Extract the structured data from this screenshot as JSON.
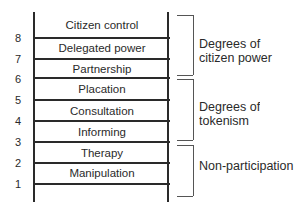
{
  "diagram": {
    "rungs": [
      {
        "level": 8,
        "label": "Citizen control"
      },
      {
        "level": 7,
        "label": "Delegated power"
      },
      {
        "level": 6,
        "label": "Partnership"
      },
      {
        "level": 5,
        "label": "Placation"
      },
      {
        "level": 4,
        "label": "Consultation"
      },
      {
        "level": 3,
        "label": "Informing"
      },
      {
        "level": 2,
        "label": "Therapy"
      },
      {
        "level": 1,
        "label": "Manipulation"
      }
    ],
    "numbers": [
      "8",
      "7",
      "6",
      "5",
      "4",
      "3",
      "2",
      "1"
    ],
    "groups": [
      {
        "line1": "Degrees of",
        "line2": "citizen power",
        "levels": [
          6,
          7,
          8
        ]
      },
      {
        "line1": "Degrees of",
        "line2": "tokenism",
        "levels": [
          3,
          4,
          5
        ]
      },
      {
        "line1": "Non-participation",
        "line2": "",
        "levels": [
          1,
          2
        ]
      }
    ]
  }
}
